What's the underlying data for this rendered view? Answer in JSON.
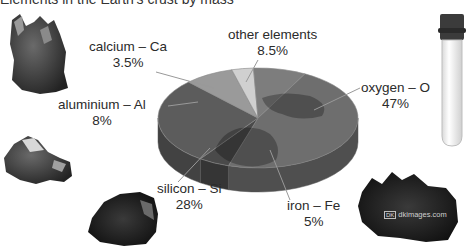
{
  "page": {
    "cut_title": "Elements in the Earth's crust by mass",
    "watermark": "dkimages.com",
    "watermark_badge": "DK"
  },
  "chart_data": {
    "type": "pie",
    "style": "3d-disc-globe",
    "title": "",
    "legend": "none",
    "slices": [
      {
        "name": "oxygen",
        "symbol": "O",
        "label": "oxygen – O",
        "value": 47,
        "value_label": "47%",
        "color": "#6e6e6e"
      },
      {
        "name": "iron",
        "symbol": "Fe",
        "label": "iron – Fe",
        "value": 5,
        "value_label": "5%",
        "color": "#4a4a4a"
      },
      {
        "name": "silicon",
        "symbol": "Si",
        "label": "silicon – Si",
        "value": 28,
        "value_label": "28%",
        "color": "#5c5c5c"
      },
      {
        "name": "aluminium",
        "symbol": "Al",
        "label": "aluminium – Al",
        "value": 8,
        "value_label": "8%",
        "color": "#9a9a9a"
      },
      {
        "name": "calcium",
        "symbol": "Ca",
        "label": "calcium – Ca",
        "value": 3.5,
        "value_label": "3.5%",
        "color": "#d0d0d0"
      },
      {
        "name": "other elements",
        "symbol": "",
        "label": "other elements",
        "value": 8.5,
        "value_label": "8.5%",
        "color": "#7d7d7d"
      }
    ],
    "units": "%"
  },
  "samples": [
    {
      "name": "calcium-crystal-sample",
      "depicts": "calcium"
    },
    {
      "name": "aluminium-ore-sample",
      "depicts": "aluminium"
    },
    {
      "name": "silicon-rock-sample",
      "depicts": "silicon"
    },
    {
      "name": "iron-ore-sample",
      "depicts": "iron"
    },
    {
      "name": "oxygen-test-tube",
      "depicts": "oxygen"
    }
  ]
}
